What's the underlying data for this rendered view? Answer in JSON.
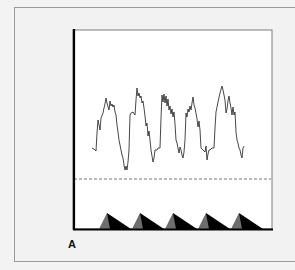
{
  "figure": {
    "panel_label": "A",
    "colors": {
      "background": "#f3f3f3",
      "plot_background": "#ffffff",
      "trace": "#333333",
      "axis": "#000000",
      "dashed_line": "#555555",
      "triangle_light": "#6e6e6e",
      "triangle_dark": "#000000"
    }
  },
  "chart_data": {
    "type": "line",
    "title": "",
    "xlabel": "",
    "ylabel": "",
    "grid": false,
    "legend": null,
    "cycles": 5,
    "series": [
      {
        "name": "trace",
        "points_px": [
          [
            92,
            148
          ],
          [
            94,
            149
          ],
          [
            96,
            151
          ],
          [
            97,
            133
          ],
          [
            98,
            120
          ],
          [
            99,
            125
          ],
          [
            100,
            130
          ],
          [
            101,
            118
          ],
          [
            103,
            113
          ],
          [
            104,
            108
          ],
          [
            105,
            104
          ],
          [
            106,
            98
          ],
          [
            107,
            103
          ],
          [
            108,
            107
          ],
          [
            109,
            110
          ],
          [
            110,
            101
          ],
          [
            111,
            106
          ],
          [
            112,
            104
          ],
          [
            113,
            107
          ],
          [
            114,
            105
          ],
          [
            115,
            112
          ],
          [
            116,
            115
          ],
          [
            117,
            125
          ],
          [
            118,
            132
          ],
          [
            119,
            140
          ],
          [
            120,
            145
          ],
          [
            121,
            150
          ],
          [
            122,
            155
          ],
          [
            123,
            158
          ],
          [
            124,
            165
          ],
          [
            125,
            170
          ],
          [
            126,
            166
          ],
          [
            127,
            170
          ],
          [
            128,
            162
          ],
          [
            129,
            150
          ],
          [
            130,
            115
          ],
          [
            131,
            113
          ],
          [
            133,
            112
          ],
          [
            135,
            115
          ],
          [
            136,
            100
          ],
          [
            137,
            88
          ],
          [
            138,
            96
          ],
          [
            139,
            93
          ],
          [
            140,
            98
          ],
          [
            141,
            96
          ],
          [
            142,
            103
          ],
          [
            143,
            101
          ],
          [
            144,
            108
          ],
          [
            145,
            116
          ],
          [
            146,
            126
          ],
          [
            147,
            123
          ],
          [
            148,
            136
          ],
          [
            149,
            131
          ],
          [
            150,
            140
          ],
          [
            151,
            150
          ],
          [
            153,
            162
          ],
          [
            154,
            158
          ],
          [
            155,
            150
          ],
          [
            157,
            150
          ],
          [
            158,
            148
          ],
          [
            160,
            148
          ],
          [
            161,
            118
          ],
          [
            162,
            95
          ],
          [
            163,
            102
          ],
          [
            164,
            94
          ],
          [
            165,
            103
          ],
          [
            166,
            96
          ],
          [
            167,
            106
          ],
          [
            168,
            99
          ],
          [
            169,
            110
          ],
          [
            170,
            106
          ],
          [
            171,
            114
          ],
          [
            172,
            109
          ],
          [
            173,
            117
          ],
          [
            174,
            112
          ],
          [
            175,
            124
          ],
          [
            176,
            140
          ],
          [
            177,
            143
          ],
          [
            178,
            148
          ],
          [
            179,
            153
          ],
          [
            180,
            147
          ],
          [
            181,
            150
          ],
          [
            182,
            155
          ],
          [
            183,
            158
          ],
          [
            184,
            152
          ],
          [
            185,
            140
          ],
          [
            186,
            113
          ],
          [
            187,
            117
          ],
          [
            188,
            109
          ],
          [
            189,
            112
          ],
          [
            190,
            106
          ],
          [
            191,
            110
          ],
          [
            192,
            103
          ],
          [
            193,
            97
          ],
          [
            194,
            105
          ],
          [
            195,
            108
          ],
          [
            196,
            113
          ],
          [
            197,
            119
          ],
          [
            198,
            127
          ],
          [
            199,
            121
          ],
          [
            200,
            130
          ],
          [
            201,
            148
          ],
          [
            203,
            150
          ],
          [
            205,
            152
          ],
          [
            206,
            146
          ],
          [
            207,
            160
          ],
          [
            208,
            154
          ],
          [
            209,
            150
          ],
          [
            210,
            150
          ],
          [
            212,
            148
          ],
          [
            213,
            148
          ],
          [
            214,
            148
          ],
          [
            215,
            128
          ],
          [
            216,
            112
          ],
          [
            218,
            102
          ],
          [
            220,
            93
          ],
          [
            222,
            86
          ],
          [
            223,
            90
          ],
          [
            224,
            95
          ],
          [
            225,
            100
          ],
          [
            226,
            113
          ],
          [
            227,
            109
          ],
          [
            228,
            101
          ],
          [
            229,
            96
          ],
          [
            230,
            103
          ],
          [
            231,
            108
          ],
          [
            232,
            115
          ],
          [
            233,
            107
          ],
          [
            234,
            115
          ],
          [
            235,
            112
          ],
          [
            236,
            132
          ],
          [
            237,
            140
          ],
          [
            238,
            143
          ],
          [
            239,
            148
          ],
          [
            240,
            150
          ],
          [
            241,
            155
          ],
          [
            242,
            158
          ],
          [
            243,
            148
          ],
          [
            244,
            146
          ]
        ]
      }
    ],
    "reference_line": {
      "style": "dashed",
      "y_px": 179
    },
    "markers": {
      "shape": "sawtooth-triangle",
      "count": 5,
      "start_x_px": [
        99,
        132,
        165,
        198,
        231
      ],
      "peak_offset_px": 8,
      "width_px": 32,
      "height_px": 16
    }
  }
}
